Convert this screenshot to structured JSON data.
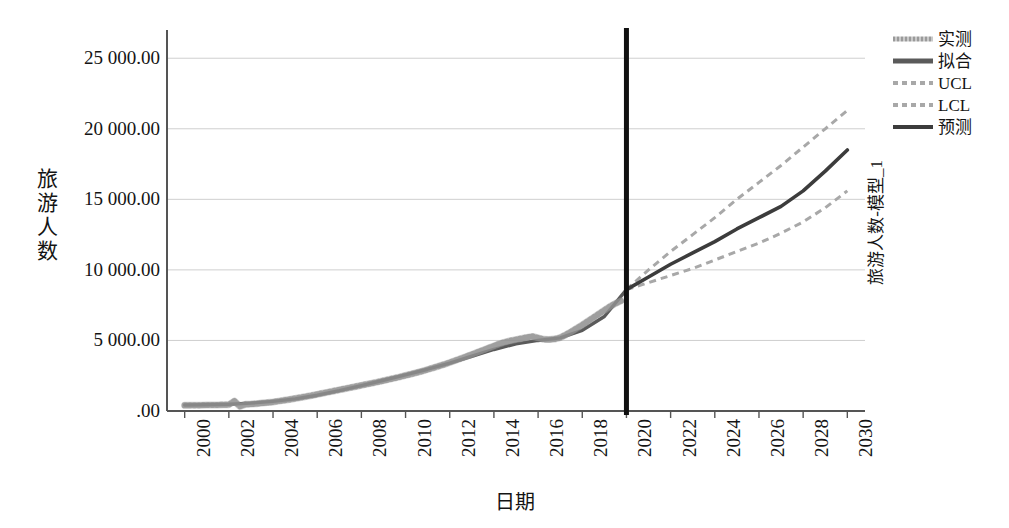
{
  "chart_data": {
    "type": "line",
    "title": "",
    "xlabel": "日期",
    "ylabel": "旅游人数",
    "right_axis_label": "旅游人数-模型_1",
    "xlim": [
      1999.2,
      2030.8
    ],
    "ylim": [
      0,
      27000
    ],
    "x_ticks": [
      "2000",
      "2002",
      "2004",
      "2006",
      "2008",
      "2010",
      "2012",
      "2014",
      "2016",
      "2018",
      "2020",
      "2022",
      "2024",
      "2026",
      "2028",
      "2030"
    ],
    "y_ticks": [
      ".00",
      "5 000.00",
      "10 000.00",
      "15 000.00",
      "20 000.00",
      "25 000.00"
    ],
    "y_tick_values": [
      0,
      5000,
      10000,
      15000,
      20000,
      25000
    ],
    "grid": true,
    "legend_position": "right",
    "forecast_divider_year": 2020,
    "colors": {
      "observed": "#9a9a9a",
      "fitted": "#5a5a5a",
      "ucl": "#a8a8a8",
      "lcl": "#a8a8a8",
      "forecast": "#3c3c3c",
      "divider": "#111111",
      "grid": "#cfcfcf",
      "axis": "#555555"
    },
    "series": [
      {
        "name": "实测",
        "style": "dotted-band",
        "x": [
          2000.0,
          2000.25,
          2000.5,
          2000.75,
          2001.0,
          2001.25,
          2001.5,
          2001.75,
          2002.0,
          2002.25,
          2002.5,
          2002.75,
          2003.0,
          2003.25,
          2003.5,
          2003.75,
          2004.0,
          2004.25,
          2004.5,
          2004.75,
          2005.0,
          2005.25,
          2005.5,
          2005.75,
          2006.0,
          2006.25,
          2006.5,
          2006.75,
          2007.0,
          2007.25,
          2007.5,
          2007.75,
          2008.0,
          2008.25,
          2008.5,
          2008.75,
          2009.0,
          2009.25,
          2009.5,
          2009.75,
          2010.0,
          2010.25,
          2010.5,
          2010.75,
          2011.0,
          2011.25,
          2011.5,
          2011.75,
          2012.0,
          2012.25,
          2012.5,
          2012.75,
          2013.0,
          2013.25,
          2013.5,
          2013.75,
          2014.0,
          2014.25,
          2014.5,
          2014.75,
          2015.0,
          2015.25,
          2015.5,
          2015.75,
          2016.0,
          2016.25,
          2016.5,
          2016.75,
          2017.0,
          2017.25,
          2017.5,
          2017.75,
          2018.0,
          2018.25,
          2018.5,
          2018.75,
          2019.0,
          2019.25,
          2019.5,
          2019.75
        ],
        "y": [
          400,
          405,
          410,
          415,
          420,
          425,
          430,
          440,
          450,
          700,
          330,
          470,
          490,
          520,
          560,
          600,
          640,
          700,
          760,
          820,
          890,
          960,
          1030,
          1100,
          1180,
          1260,
          1340,
          1420,
          1500,
          1580,
          1660,
          1740,
          1820,
          1900,
          1980,
          2060,
          2150,
          2240,
          2330,
          2420,
          2520,
          2620,
          2720,
          2820,
          2940,
          3060,
          3180,
          3300,
          3440,
          3580,
          3720,
          3860,
          4010,
          4160,
          4310,
          4460,
          4610,
          4760,
          4880,
          4980,
          5060,
          5140,
          5220,
          5280,
          5180,
          5080,
          5060,
          5100,
          5200,
          5400,
          5620,
          5860,
          6100,
          6360,
          6620,
          6880,
          7140,
          7400,
          7620,
          7800
        ]
      },
      {
        "name": "拟合",
        "style": "solid",
        "x": [
          2000,
          2001,
          2002,
          2003,
          2004,
          2005,
          2006,
          2007,
          2008,
          2009,
          2010,
          2011,
          2012,
          2013,
          2014,
          2015,
          2016,
          2017,
          2018,
          2019,
          2020
        ],
        "y": [
          420,
          440,
          480,
          560,
          680,
          860,
          1120,
          1440,
          1800,
          2180,
          2560,
          2960,
          3400,
          3880,
          4360,
          4760,
          5000,
          5180,
          5720,
          6700,
          8600
        ]
      },
      {
        "name": "预测",
        "style": "solid",
        "x": [
          2020,
          2021,
          2022,
          2023,
          2024,
          2025,
          2026,
          2027,
          2028,
          2029,
          2030
        ],
        "y": [
          8600,
          9500,
          10400,
          11200,
          12000,
          12900,
          13700,
          14500,
          15600,
          17000,
          18500
        ]
      },
      {
        "name": "UCL",
        "style": "dashed",
        "x": [
          2020,
          2021,
          2022,
          2023,
          2024,
          2025,
          2026,
          2027,
          2028,
          2029,
          2030
        ],
        "y": [
          8600,
          10000,
          11300,
          12500,
          13700,
          15000,
          16200,
          17400,
          18700,
          20000,
          21300
        ]
      },
      {
        "name": "LCL",
        "style": "dashed",
        "x": [
          2020,
          2021,
          2022,
          2023,
          2024,
          2025,
          2026,
          2027,
          2028,
          2029,
          2030
        ],
        "y": [
          8600,
          9100,
          9600,
          10100,
          10700,
          11300,
          11900,
          12600,
          13400,
          14400,
          15600
        ]
      }
    ]
  },
  "legend": {
    "items": [
      {
        "label": "实测",
        "key": "observed"
      },
      {
        "label": "拟合",
        "key": "fitted"
      },
      {
        "label": "UCL",
        "key": "ucl"
      },
      {
        "label": "LCL",
        "key": "lcl"
      },
      {
        "label": "预测",
        "key": "forecast"
      }
    ]
  },
  "axes": {
    "y_title_chars": [
      "旅",
      "游",
      "人",
      "数"
    ],
    "x_title": "日期",
    "right_title": "旅游人数-模型_1"
  }
}
